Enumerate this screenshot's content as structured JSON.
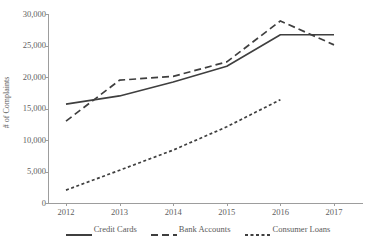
{
  "chart_data": {
    "type": "line",
    "title": "",
    "xlabel": "",
    "ylabel": "# of Complaints",
    "categories": [
      "2012",
      "2013",
      "2014",
      "2015",
      "2016",
      "2017"
    ],
    "x": [
      2012,
      2013,
      2014,
      2015,
      2016,
      2017
    ],
    "xlim": [
      2012,
      2017
    ],
    "ylim": [
      0,
      30000
    ],
    "ytick_labels": [
      "0",
      "5,000",
      "10,000",
      "15,000",
      "20,000",
      "25,000",
      "30,000"
    ],
    "ytick_values": [
      0,
      5000,
      10000,
      15000,
      20000,
      25000,
      30000
    ],
    "grid": false,
    "legend_position": "bottom",
    "series": [
      {
        "name": "Credit Cards",
        "style": "solid",
        "color": "#3f3f3f",
        "values": [
          15700,
          17000,
          19200,
          21700,
          26700,
          26700
        ]
      },
      {
        "name": "Bank Accounts",
        "style": "dashed",
        "color": "#3f3f3f",
        "values": [
          13000,
          19500,
          20100,
          22400,
          28900,
          25100
        ]
      },
      {
        "name": "Consumer Loans",
        "style": "dotted",
        "color": "#3f3f3f",
        "values": [
          2050,
          5200,
          8400,
          12100,
          16400,
          null
        ]
      }
    ]
  },
  "axes": {
    "y_title": "# of Complaints"
  },
  "legend": {
    "items": [
      {
        "label": "Credit Cards",
        "swatch": "solid-line-swatch"
      },
      {
        "label": "Bank Accounts",
        "swatch": "dashed-line-swatch"
      },
      {
        "label": "Consumer Loans",
        "swatch": "dotted-line-swatch"
      }
    ]
  }
}
